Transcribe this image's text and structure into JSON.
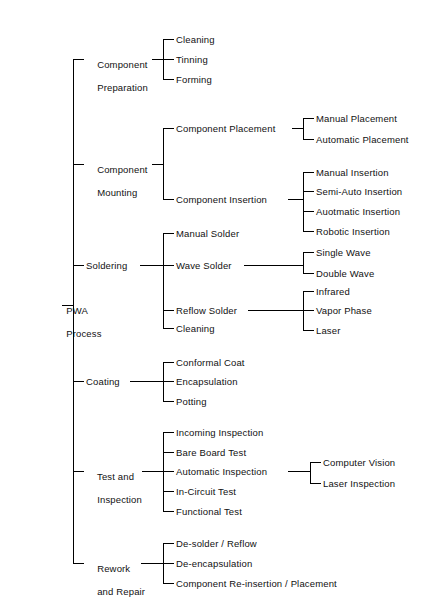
{
  "diagram": {
    "title": "PWA Process",
    "type": "tree",
    "width": 446,
    "height": 613,
    "line_color": "#000000",
    "text_color": "#111111",
    "background": "#ffffff"
  },
  "root": {
    "label_line1": "PWA",
    "label_line2": "Process"
  },
  "branches": [
    {
      "id": "component-preparation",
      "label_line1": "Component",
      "label_line2": "Preparation",
      "children": [
        {
          "id": "cleaning",
          "label": "Cleaning"
        },
        {
          "id": "tinning",
          "label": "Tinning"
        },
        {
          "id": "forming",
          "label": "Forming"
        }
      ]
    },
    {
      "id": "component-mounting",
      "label_line1": "Component",
      "label_line2": "Mounting",
      "children": [
        {
          "id": "component-placement",
          "label": "Component Placement",
          "children": [
            {
              "id": "manual-placement",
              "label": "Manual Placement"
            },
            {
              "id": "automatic-placement",
              "label": "Automatic Placement"
            }
          ]
        },
        {
          "id": "component-insertion",
          "label": "Component Insertion",
          "children": [
            {
              "id": "manual-insertion",
              "label": "Manual Insertion"
            },
            {
              "id": "semi-auto-insertion",
              "label": "Semi-Auto Insertion"
            },
            {
              "id": "auotmatic-insertion",
              "label": "Auotmatic Insertion"
            },
            {
              "id": "robotic-insertion",
              "label": "Robotic Insertion"
            }
          ]
        }
      ]
    },
    {
      "id": "soldering",
      "label_line1": "Soldering",
      "label_line2": "",
      "children": [
        {
          "id": "manual-solder",
          "label": "Manual Solder"
        },
        {
          "id": "wave-solder",
          "label": "Wave Solder",
          "children": [
            {
              "id": "single-wave",
              "label": "Single Wave"
            },
            {
              "id": "double-wave",
              "label": "Double Wave"
            }
          ]
        },
        {
          "id": "reflow-solder",
          "label": "Reflow Solder",
          "children": [
            {
              "id": "infrared",
              "label": "Infrared"
            },
            {
              "id": "vapor-phase",
              "label": "Vapor Phase"
            },
            {
              "id": "laser",
              "label": "Laser"
            }
          ]
        },
        {
          "id": "cleaning-solder",
          "label": "Cleaning"
        }
      ]
    },
    {
      "id": "coating",
      "label_line1": "Coating",
      "label_line2": "",
      "children": [
        {
          "id": "conformal-coat",
          "label": "Conformal Coat"
        },
        {
          "id": "encapsulation",
          "label": "Encapsulation"
        },
        {
          "id": "potting",
          "label": "Potting"
        }
      ]
    },
    {
      "id": "test-and-inspection",
      "label_line1": "Test and",
      "label_line2": "Inspection",
      "children": [
        {
          "id": "incoming-inspection",
          "label": "Incoming Inspection"
        },
        {
          "id": "bare-board-test",
          "label": "Bare Board Test"
        },
        {
          "id": "automatic-inspection",
          "label": "Automatic Inspection",
          "children": [
            {
              "id": "computer-vision",
              "label": "Computer Vision"
            },
            {
              "id": "laser-inspection",
              "label": "Laser Inspection"
            }
          ]
        },
        {
          "id": "in-circuit-test",
          "label": "In-Circuit Test"
        },
        {
          "id": "functional-test",
          "label": "Functional Test"
        }
      ]
    },
    {
      "id": "rework-and-repair",
      "label_line1": "Rework",
      "label_line2": "and Repair",
      "children": [
        {
          "id": "de-solder-reflow",
          "label": "De-solder / Reflow"
        },
        {
          "id": "de-encapsulation",
          "label": "De-encapsulation"
        },
        {
          "id": "component-re-insertion",
          "label": "Component Re-insertion / Placement"
        }
      ]
    }
  ]
}
